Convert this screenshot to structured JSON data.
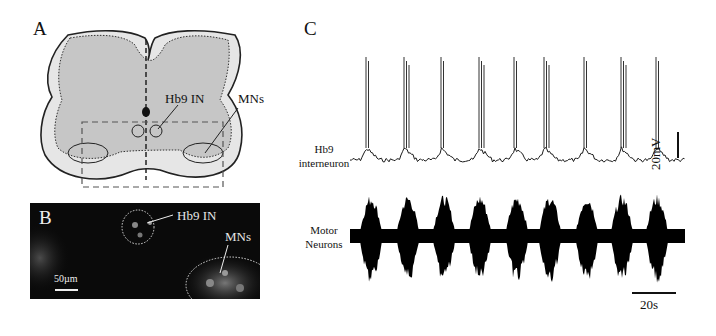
{
  "figure": {
    "panels": [
      {
        "id": "A",
        "letter": "A",
        "type": "spinal-cord-schematic",
        "labels": {
          "interneuron": "Hb9 IN",
          "motor": "MNs"
        }
      },
      {
        "id": "B",
        "letter": "B",
        "type": "fluorescence-micrograph",
        "labels": {
          "interneuron": "Hb9 IN",
          "motor": "MNs",
          "scale_bar": "50µm"
        }
      },
      {
        "id": "C",
        "letter": "C",
        "type": "electrophysiology-traces",
        "traces": [
          {
            "label_line1": "Hb9",
            "label_line2": "interneuron"
          },
          {
            "label_line1": "Motor",
            "label_line2": "Neurons"
          }
        ],
        "scale_bars": {
          "voltage": "20mV",
          "time": "20s"
        }
      }
    ]
  },
  "chart_data": {
    "type": "line",
    "title": "",
    "series": [
      {
        "name": "Hb9 interneuron",
        "burst_times_px": [
          366,
          404,
          441,
          479,
          514,
          544,
          584,
          621,
          656
        ]
      },
      {
        "name": "Motor Neurons",
        "burst_times_px": [
          371,
          408,
          444,
          480,
          517,
          550,
          587,
          622,
          657
        ]
      }
    ],
    "xlabel": "",
    "ylabel": "",
    "scale_bars": {
      "voltage": "20mV",
      "time": "20s"
    }
  }
}
